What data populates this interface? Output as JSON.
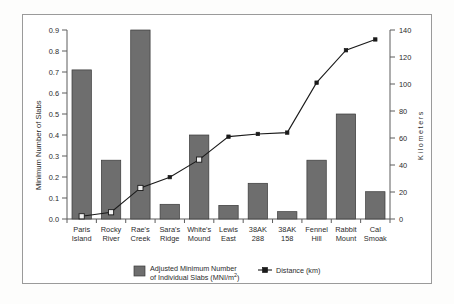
{
  "chart_data": {
    "type": "bar",
    "title": "",
    "subtitle": "",
    "xlabel": "",
    "ylabel": "Minimum Number of Slabs",
    "y2label": "Kilometers",
    "ylim": [
      0.0,
      0.9
    ],
    "y2lim": [
      0,
      140
    ],
    "grid": false,
    "legend_position": "bottom",
    "categories": [
      "Paris Island",
      "Rocky River",
      "Rae's Creek",
      "Sara's Ridge",
      "White's Mound",
      "Lewis East",
      "38AK 288",
      "38AK 158",
      "Fennel Hill",
      "Rabbit Mount",
      "Cal Smoak"
    ],
    "category_lines": [
      [
        "Paris",
        "Island"
      ],
      [
        "Rocky",
        "River"
      ],
      [
        "Rae's",
        "Creek"
      ],
      [
        "Sara's",
        "Ridge"
      ],
      [
        "White's",
        "Mound"
      ],
      [
        "Lewis",
        "East"
      ],
      [
        "38AK",
        "288"
      ],
      [
        "38AK",
        "158"
      ],
      [
        "Fennel",
        "Hill"
      ],
      [
        "Rabbit",
        "Mount"
      ],
      [
        "Cal",
        "Smoak"
      ]
    ],
    "ytick_labels": [
      "0.9",
      "0.8",
      "0.7",
      "0.6",
      "0.5",
      "0.4",
      "0.3",
      "0.2",
      "0.1",
      "0.0"
    ],
    "ytick_values": [
      0.9,
      0.8,
      0.7,
      0.6,
      0.5,
      0.4,
      0.3,
      0.2,
      0.1,
      0.0
    ],
    "y2tick_labels": [
      "140",
      "120",
      "100",
      "80",
      "60",
      "40",
      "20",
      "0"
    ],
    "y2tick_values": [
      140,
      120,
      100,
      80,
      60,
      40,
      20,
      0
    ],
    "series": [
      {
        "name": "Adjusted Minimum Number of Individual Slabs (MNI/m2)",
        "kind": "bar",
        "axis": "left",
        "values": [
          0.71,
          0.28,
          0.9,
          0.07,
          0.4,
          0.065,
          0.17,
          0.035,
          0.28,
          0.5,
          0.13
        ]
      },
      {
        "name": "Distance (km)",
        "kind": "line",
        "axis": "right",
        "values": [
          2,
          5,
          23,
          31,
          44,
          61,
          63,
          64,
          101,
          125,
          133
        ],
        "open_markers": [
          0,
          1,
          2,
          4
        ]
      }
    ],
    "legend": [
      {
        "label_line1": "Adjusted Minimum Number",
        "label_line2": "of Individual Slabs (MNI/m",
        "label_sup": "2",
        "label_tail": ")",
        "marker": "filled-square-swatch"
      },
      {
        "label": "Distance (km)",
        "marker": "line-with-square-marker"
      }
    ]
  }
}
